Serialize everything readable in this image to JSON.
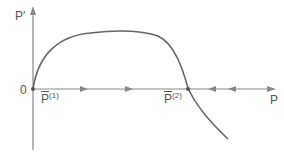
{
  "diagram": {
    "type": "phase-line",
    "y_axis_label": "P′",
    "x_axis_label": "P",
    "origin_label": "0",
    "equilibria": [
      {
        "label_base": "P",
        "label_sup": "(1)",
        "stability": "unstable"
      },
      {
        "label_base": "P",
        "label_sup": "(2)",
        "stability": "stable"
      }
    ],
    "flow_arrows": [
      {
        "direction": "right"
      },
      {
        "direction": "right"
      },
      {
        "direction": "left"
      },
      {
        "direction": "left"
      }
    ],
    "colors": {
      "axis": "#888888",
      "curve": "#666666",
      "text": "#555555"
    }
  }
}
